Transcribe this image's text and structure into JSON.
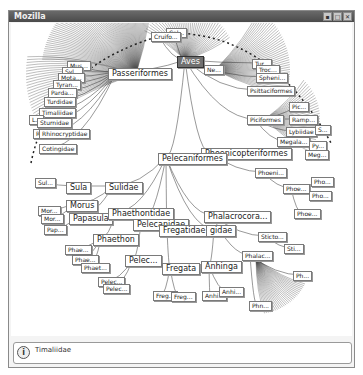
{
  "window": {
    "title": "Mozilla",
    "buttons": {
      "minimize": "▪",
      "maximize": "□",
      "close": "✕"
    }
  },
  "tree": {
    "root": "Aves",
    "nodes": [
      {
        "id": "aves",
        "label": "Aves",
        "x": 176,
        "y": 55,
        "big": true,
        "selected": true
      },
      {
        "id": "ne",
        "label": "Ne...",
        "x": 203,
        "y": 64
      },
      {
        "id": "cal",
        "label": "Cal...",
        "x": 165,
        "y": 27
      },
      {
        "id": "cruifo",
        "label": "Cruifo...",
        "x": 150,
        "y": 31
      },
      {
        "id": "passeriformes",
        "label": "Passeriformes",
        "x": 107,
        "y": 67,
        "big": true
      },
      {
        "id": "mus",
        "label": "Mus...",
        "x": 66,
        "y": 60
      },
      {
        "id": "syl",
        "label": "Syl...",
        "x": 61,
        "y": 66
      },
      {
        "id": "mota",
        "label": "Mota...",
        "x": 57,
        "y": 72
      },
      {
        "id": "tyran",
        "label": "Tyran...",
        "x": 52,
        "y": 79
      },
      {
        "id": "parda",
        "label": "Parda...",
        "x": 47,
        "y": 87
      },
      {
        "id": "turdidae",
        "label": "Turdidae",
        "x": 43,
        "y": 96
      },
      {
        "id": "timaliidae",
        "label": "Timaliidae",
        "x": 38,
        "y": 107
      },
      {
        "id": "l",
        "label": "L...",
        "x": 28,
        "y": 114
      },
      {
        "id": "sturnidae",
        "label": "Sturnidae",
        "x": 36,
        "y": 117
      },
      {
        "id": "r",
        "label": "R",
        "x": 32,
        "y": 128
      },
      {
        "id": "rhinocryptidae",
        "label": "Rhinocryptidae",
        "x": 38,
        "y": 128
      },
      {
        "id": "cotingidae",
        "label": "Cotingidae",
        "x": 38,
        "y": 143
      },
      {
        "id": "tur",
        "label": "Tur...",
        "x": 251,
        "y": 58
      },
      {
        "id": "troc",
        "label": "Troc...",
        "x": 255,
        "y": 64
      },
      {
        "id": "spheni",
        "label": "Spheni...",
        "x": 255,
        "y": 72
      },
      {
        "id": "psittaciformes",
        "label": "Psittaciformes",
        "x": 246,
        "y": 85
      },
      {
        "id": "pic",
        "label": "Pic...",
        "x": 288,
        "y": 101
      },
      {
        "id": "piciformes",
        "label": "Piciformes",
        "x": 246,
        "y": 114
      },
      {
        "id": "ramp",
        "label": "Ramp...",
        "x": 288,
        "y": 114
      },
      {
        "id": "lybiidae",
        "label": "Lybiidae",
        "x": 285,
        "y": 126
      },
      {
        "id": "s",
        "label": "S...",
        "x": 314,
        "y": 124
      },
      {
        "id": "megala",
        "label": "Megala...",
        "x": 276,
        "y": 136
      },
      {
        "id": "py",
        "label": "Py...",
        "x": 308,
        "y": 140
      },
      {
        "id": "meg",
        "label": "Meg...",
        "x": 304,
        "y": 149
      },
      {
        "id": "phoenicopteriformes",
        "label": "Phoenicopteriformes",
        "x": 200,
        "y": 147,
        "big": true
      },
      {
        "id": "pelecaniformes",
        "label": "Pelecaniformes",
        "x": 157,
        "y": 152,
        "big": true
      },
      {
        "id": "phoeni",
        "label": "Phoeni...",
        "x": 254,
        "y": 167
      },
      {
        "id": "pho1",
        "label": "Pho...",
        "x": 310,
        "y": 176
      },
      {
        "id": "phoe1",
        "label": "Phoe...",
        "x": 282,
        "y": 183
      },
      {
        "id": "pho2",
        "label": "Pho...",
        "x": 308,
        "y": 190
      },
      {
        "id": "phoe2",
        "label": "Phoe...",
        "x": 293,
        "y": 208
      },
      {
        "id": "sul",
        "label": "Sul...",
        "x": 34,
        "y": 177
      },
      {
        "id": "sula",
        "label": "Sula",
        "x": 65,
        "y": 181,
        "big": true
      },
      {
        "id": "sulidae",
        "label": "Sulidae",
        "x": 104,
        "y": 181,
        "big": true
      },
      {
        "id": "morus",
        "label": "Morus",
        "x": 65,
        "y": 199,
        "big": true
      },
      {
        "id": "mor1",
        "label": "Mor...",
        "x": 37,
        "y": 205
      },
      {
        "id": "mor2",
        "label": "Mor...",
        "x": 40,
        "y": 213
      },
      {
        "id": "papasula",
        "label": "Papasula",
        "x": 68,
        "y": 212,
        "big": true
      },
      {
        "id": "pap",
        "label": "Pap...",
        "x": 43,
        "y": 224
      },
      {
        "id": "phaethontidae",
        "label": "Phaethontidae",
        "x": 107,
        "y": 207,
        "big": true
      },
      {
        "id": "pelecanidae",
        "label": "Pelecanidae",
        "x": 132,
        "y": 218,
        "big": true
      },
      {
        "id": "fregatidae",
        "label": "Fregatidae",
        "x": 158,
        "y": 224,
        "big": true
      },
      {
        "id": "phalacrocoridae",
        "label": "Phalacrocora...",
        "x": 203,
        "y": 210,
        "big": true
      },
      {
        "id": "gidae",
        "label": "gidae",
        "x": 205,
        "y": 224,
        "big": true
      },
      {
        "id": "phaethon",
        "label": "Phaethon",
        "x": 92,
        "y": 233,
        "big": true
      },
      {
        "id": "phae1",
        "label": "Phae...",
        "x": 64,
        "y": 244
      },
      {
        "id": "phae2",
        "label": "Phae...",
        "x": 71,
        "y": 254
      },
      {
        "id": "phaet",
        "label": "Phaet...",
        "x": 80,
        "y": 262
      },
      {
        "id": "pelec",
        "label": "Pelec...",
        "x": 124,
        "y": 254,
        "big": true
      },
      {
        "id": "pelec2",
        "label": "Pelec...",
        "x": 97,
        "y": 276
      },
      {
        "id": "pelec3",
        "label": "Pelec...",
        "x": 102,
        "y": 283
      },
      {
        "id": "fregata",
        "label": "Fregata",
        "x": 161,
        "y": 262,
        "big": true
      },
      {
        "id": "freg1",
        "label": "Freg...",
        "x": 152,
        "y": 290
      },
      {
        "id": "freg2",
        "label": "Freg...",
        "x": 170,
        "y": 291
      },
      {
        "id": "anhinga",
        "label": "Anhinga",
        "x": 200,
        "y": 260,
        "big": true
      },
      {
        "id": "anhi1",
        "label": "Anhi...",
        "x": 201,
        "y": 290
      },
      {
        "id": "anhi2",
        "label": "Anhi...",
        "x": 218,
        "y": 286
      },
      {
        "id": "stictο",
        "label": "Sticto...",
        "x": 257,
        "y": 231
      },
      {
        "id": "sti",
        "label": "Sti...",
        "x": 283,
        "y": 243
      },
      {
        "id": "phalac",
        "label": "Phalac...",
        "x": 241,
        "y": 250
      },
      {
        "id": "ph",
        "label": "Ph...",
        "x": 292,
        "y": 270
      },
      {
        "id": "phn",
        "label": "Phn...",
        "x": 248,
        "y": 300
      }
    ]
  },
  "status": {
    "icon": "info-icon",
    "text": "Timaliidae"
  }
}
